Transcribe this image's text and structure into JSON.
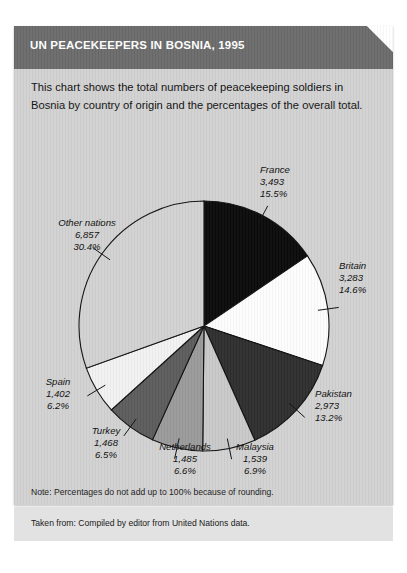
{
  "header": {
    "title": "UN PEACEKEEPERS IN BOSNIA, 1995",
    "bar_color": "#6b6b6b",
    "title_color": "#ffffff"
  },
  "intro": {
    "text": "This chart shows the total numbers of peacekeeping soldiers in Bosnia by country of origin and the percentages of the overall total."
  },
  "notes": {
    "note": "Note: Percentages do not add up to 100% because of rounding.",
    "source": "Taken from: Compiled by editor from United Nations data."
  },
  "card": {
    "background_color": "#d2d2d2",
    "footer_band_color": "#e2e2e2"
  },
  "chart_data": {
    "type": "pie",
    "title": "UN PEACEKEEPERS IN BOSNIA, 1995",
    "subtitle": "This chart shows the total numbers of peacekeeping soldiers in Bosnia by country of origin and the percentages of the overall total.",
    "value_label": "Soldiers",
    "legend_position": "callout-labels",
    "grid": false,
    "total_note": "Percentages do not add up to 100% because of rounding.",
    "start_angle_deg": 0,
    "direction": "clockwise",
    "categories": [
      "France",
      "Britain",
      "Pakistan",
      "Malaysia",
      "Netherlands",
      "Turkey",
      "Spain",
      "Other nations"
    ],
    "values": [
      3493,
      3283,
      2973,
      1539,
      1485,
      1468,
      1402,
      6857
    ],
    "value_labels": [
      "3,493",
      "3,283",
      "2,973",
      "1,539",
      "1,485",
      "1,468",
      "1,402",
      "6,857"
    ],
    "percentages": [
      15.5,
      14.6,
      13.2,
      6.9,
      6.6,
      6.5,
      6.2,
      30.4
    ],
    "percent_labels": [
      "15.5%",
      "14.6%",
      "13.2%",
      "6.9%",
      "6.6%",
      "6.5%",
      "6.2%",
      "30.4%"
    ],
    "colors": [
      "#0a0a0a",
      "#fdfdfd",
      "#2e2e2e",
      "#c9c9c9",
      "#9a9a9a",
      "#5c5c5c",
      "#f2f2f2",
      "#d2d2d2"
    ],
    "slices": [
      {
        "name": "France",
        "value": 3493,
        "value_label": "3,493",
        "percent": 15.5,
        "percent_label": "15.5%",
        "color": "#0a0a0a"
      },
      {
        "name": "Britain",
        "value": 3283,
        "value_label": "3,283",
        "percent": 14.6,
        "percent_label": "14.6%",
        "color": "#fdfdfd"
      },
      {
        "name": "Pakistan",
        "value": 2973,
        "value_label": "2,973",
        "percent": 13.2,
        "percent_label": "13.2%",
        "color": "#2e2e2e"
      },
      {
        "name": "Malaysia",
        "value": 1539,
        "value_label": "1,539",
        "percent": 6.9,
        "percent_label": "6.9%",
        "color": "#c9c9c9"
      },
      {
        "name": "Netherlands",
        "value": 1485,
        "value_label": "1,485",
        "percent": 6.6,
        "percent_label": "6.6%",
        "color": "#9a9a9a"
      },
      {
        "name": "Turkey",
        "value": 1468,
        "value_label": "1,468",
        "percent": 6.5,
        "percent_label": "6.5%",
        "color": "#5c5c5c"
      },
      {
        "name": "Spain",
        "value": 1402,
        "value_label": "1,402",
        "percent": 6.2,
        "percent_label": "6.2%",
        "color": "#f2f2f2"
      },
      {
        "name": "Other nations",
        "value": 6857,
        "value_label": "6,857",
        "percent": 30.4,
        "percent_label": "30.4%",
        "color": "#d2d2d2"
      }
    ]
  }
}
